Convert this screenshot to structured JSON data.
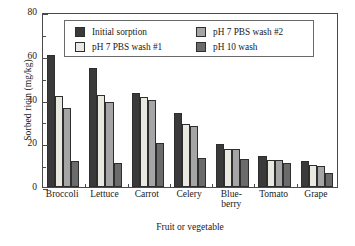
{
  "chart_data": {
    "type": "bar",
    "title": "",
    "xlabel": "Fruit or vegetable",
    "ylabel": "Sorbed ricin (mg/kg)",
    "ylim": [
      0,
      80
    ],
    "yticks": [
      0,
      20,
      40,
      60,
      80
    ],
    "yticks_minor": [
      10,
      30,
      50,
      70
    ],
    "grid": false,
    "legend_position": "upper center inside",
    "categories": [
      "Broccoli",
      "Lettuce",
      "Carrot",
      "Celery",
      "Blue-berry",
      "Tomato",
      "Grape"
    ],
    "category_lines": [
      [
        "Broccoli"
      ],
      [
        "Lettuce"
      ],
      [
        "Carrot"
      ],
      [
        "Celery"
      ],
      [
        "Blue-",
        "berry"
      ],
      [
        "Tomato"
      ],
      [
        "Grape"
      ]
    ],
    "series": [
      {
        "name": "Initial sorption",
        "color": "#3a3a3a",
        "values": [
          60.2,
          54.5,
          43.0,
          34.0,
          19.8,
          14.0,
          11.8
        ]
      },
      {
        "name": "pH 7 PBS wash #1",
        "color": "#e9e9e1",
        "values": [
          41.8,
          42.0,
          41.0,
          28.8,
          17.6,
          12.4,
          9.9
        ]
      },
      {
        "name": "pH 7 PBS wash #2",
        "color": "#a5a5a5",
        "values": [
          36.0,
          38.8,
          39.8,
          27.8,
          17.2,
          12.4,
          9.8
        ]
      },
      {
        "name": "pH 10 wash",
        "color": "#6b6b6b",
        "values": [
          11.9,
          11.0,
          20.0,
          13.4,
          12.8,
          11.0,
          6.4
        ]
      }
    ]
  },
  "axis": {
    "ytick_labels": [
      "0",
      "20",
      "40",
      "60",
      "80"
    ]
  }
}
